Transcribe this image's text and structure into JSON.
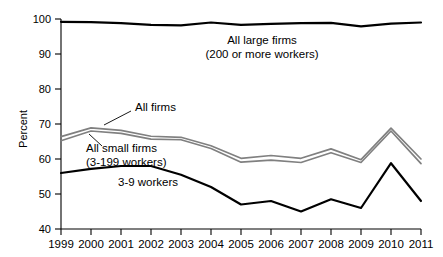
{
  "chart_data": {
    "type": "line",
    "title": "",
    "xlabel": "",
    "ylabel": "Percent",
    "ylim": [
      40,
      100
    ],
    "yticks": [
      40,
      50,
      60,
      70,
      80,
      90,
      100
    ],
    "grid": false,
    "legend": "inline-annotations",
    "x": [
      "1999",
      "2000",
      "2001",
      "2002",
      "2003",
      "2004",
      "2005",
      "2006",
      "2007",
      "2008",
      "2009",
      "2010",
      "2011"
    ],
    "categories": [
      "1999",
      "2000",
      "2001",
      "2002",
      "2003",
      "2004",
      "2005",
      "2006",
      "2007",
      "2008",
      "2009",
      "2010",
      "2011"
    ],
    "series": [
      {
        "name": "All large firms (200 or more workers)",
        "color": "#000000",
        "values": [
          99.2,
          99.1,
          98.8,
          98.3,
          98.2,
          99.0,
          98.3,
          98.6,
          98.8,
          98.9,
          97.9,
          98.7,
          99.0
        ]
      },
      {
        "name": "All firms",
        "color": "#808080",
        "values": [
          66.4,
          68.9,
          68.2,
          66.5,
          66.2,
          63.8,
          60.2,
          61.0,
          60.2,
          62.9,
          59.8,
          68.8,
          60.0
        ]
      },
      {
        "name": "All small firms (3-199 workers)",
        "color": "#808080",
        "values": [
          65.2,
          68.0,
          67.3,
          65.7,
          65.5,
          63.0,
          59.1,
          59.7,
          59.0,
          61.8,
          59.0,
          68.0,
          58.7
        ]
      },
      {
        "name": "3-9 workers",
        "color": "#000000",
        "values": [
          56.0,
          57.2,
          58.0,
          58.0,
          55.5,
          52.0,
          47.0,
          48.0,
          45.0,
          48.5,
          46.0,
          58.8,
          48.0
        ]
      }
    ],
    "annotations": [
      {
        "id": "large-firms",
        "lines": [
          "All large firms",
          "(200 or more workers)"
        ]
      },
      {
        "id": "all-firms",
        "lines": [
          "All firms"
        ]
      },
      {
        "id": "small-firms",
        "lines": [
          "All small firms",
          "(3-199 workers)"
        ]
      },
      {
        "id": "small-workers",
        "lines": [
          "3-9 workers"
        ]
      }
    ]
  },
  "axis": {
    "y_title": "Percent",
    "y_ticks": [
      "100",
      "90",
      "80",
      "70",
      "60",
      "50",
      "40"
    ],
    "x_ticks": [
      "1999",
      "2000",
      "2001",
      "2002",
      "2003",
      "2004",
      "2005",
      "2006",
      "2007",
      "2008",
      "2009",
      "2010",
      "2011"
    ]
  },
  "labels": {
    "large_firms_line1": "All large firms",
    "large_firms_line2": "(200 or more workers)",
    "all_firms": "All firms",
    "small_firms_line1": "All small firms",
    "small_firms_line2": "(3-199 workers)",
    "workers_3_9": "3-9 workers"
  },
  "colors": {
    "axis": "#000000",
    "black_series": "#000000",
    "gray_series": "#808080",
    "background": "#ffffff"
  }
}
